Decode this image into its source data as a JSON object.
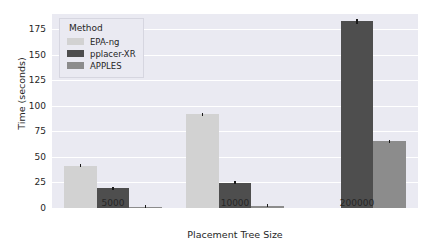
{
  "chart_data": {
    "type": "bar",
    "title": "",
    "xlabel": "Placement Tree Size",
    "ylabel": "Time (seconds)",
    "categories": [
      "5000",
      "10000",
      "200000"
    ],
    "ylim": [
      0,
      190
    ],
    "yticks": [
      0,
      25,
      50,
      75,
      100,
      125,
      150,
      175
    ],
    "ytick_labels": [
      "0",
      "25",
      "50",
      "75",
      "100",
      "125",
      "150",
      "175"
    ],
    "grid": true,
    "legend_position": "upper left",
    "legend_title": "Method",
    "series": [
      {
        "name": "EPA-ng",
        "color": "#d2d2d2",
        "values": [
          41.5,
          91.8,
          null
        ],
        "errors": [
          1.8,
          1.0,
          null
        ]
      },
      {
        "name": "pplacer-XR",
        "color": "#4e4e4e",
        "values": [
          19.2,
          24.8,
          183.0
        ],
        "errors": [
          1.2,
          1.2,
          2.5
        ]
      },
      {
        "name": "APPLES",
        "color": "#8c8c8c",
        "values": [
          1.0,
          2.0,
          65.5
        ],
        "errors": [
          0.4,
          0.5,
          1.5
        ]
      }
    ]
  },
  "style": {
    "background": "#ffffff",
    "axes_facecolor": "#eaeaf2",
    "gridline_color": "#ffffff",
    "text_color": "#262626"
  }
}
